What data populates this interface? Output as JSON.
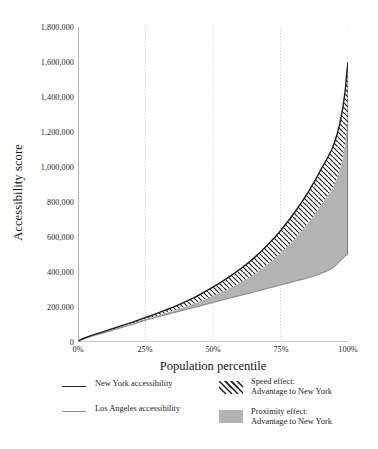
{
  "chart_data": {
    "type": "area",
    "title": "",
    "xlabel": "Population percentile",
    "ylabel": "Accessibility score",
    "xlim": [
      0,
      100
    ],
    "ylim": [
      0,
      1800000
    ],
    "grid": "vertical-dotted",
    "x_ticks": [
      "0%",
      "25%",
      "50%",
      "75%",
      "100%"
    ],
    "x_tick_values": [
      0,
      25,
      50,
      75,
      100
    ],
    "y_ticks": [
      "0",
      "200,000",
      "400,000",
      "600,000",
      "800,000",
      "1,000,000",
      "1,200,000",
      "1,400,000",
      "1,600,000",
      "1,800,000"
    ],
    "y_tick_values": [
      0,
      200000,
      400000,
      600000,
      800000,
      1000000,
      1200000,
      1400000,
      1600000,
      1800000
    ],
    "x": [
      0,
      2,
      5,
      8,
      10,
      15,
      20,
      25,
      28,
      30,
      33,
      35,
      38,
      40,
      43,
      45,
      48,
      50,
      53,
      55,
      58,
      60,
      63,
      65,
      68,
      70,
      73,
      75,
      78,
      80,
      83,
      85,
      88,
      90,
      92,
      94,
      95,
      96,
      97,
      98,
      99,
      99.5,
      100
    ],
    "series": [
      {
        "name": "New York accessibility",
        "color": "#222222",
        "values": [
          6000,
          20000,
          38000,
          52000,
          62000,
          88000,
          112000,
          140000,
          156000,
          168000,
          186000,
          198000,
          218000,
          232000,
          254000,
          270000,
          296000,
          314000,
          342000,
          362000,
          394000,
          416000,
          452000,
          478000,
          520000,
          552000,
          600000,
          636000,
          694000,
          736000,
          802000,
          850000,
          928000,
          986000,
          1040000,
          1100000,
          1140000,
          1190000,
          1250000,
          1330000,
          1440000,
          1530000,
          1600000
        ]
      },
      {
        "name": "Los Angeles accessibility",
        "color": "#8e8e8e",
        "values": [
          4000,
          17000,
          33000,
          46000,
          55000,
          78000,
          100000,
          125000,
          138000,
          146000,
          158000,
          166000,
          178000,
          186000,
          198000,
          206000,
          218000,
          226000,
          238000,
          246000,
          258000,
          266000,
          278000,
          286000,
          298000,
          306000,
          318000,
          326000,
          338000,
          346000,
          358000,
          366000,
          380000,
          392000,
          404000,
          420000,
          432000,
          446000,
          462000,
          478000,
          492000,
          498000,
          500000
        ]
      },
      {
        "name": "speed-effect-band-lower",
        "color": "#ffffff",
        "values": [
          5000,
          18500,
          35000,
          48500,
          58000,
          82000,
          105000,
          131000,
          145000,
          154000,
          169000,
          178000,
          193000,
          203000,
          220000,
          231000,
          250000,
          263000,
          284000,
          299000,
          322000,
          339000,
          366000,
          386000,
          418000,
          443000,
          480000,
          508000,
          553000,
          586000,
          638000,
          676000,
          738000,
          784000,
          826000,
          873000,
          904000,
          942000,
          988000,
          1050000,
          1140000,
          1210000,
          1265000
        ]
      }
    ],
    "annotations": [
      "Speed effect: hatched band between New York curve and intermediate curve",
      "Proximity effect: solid gray fill between intermediate curve and Los Angeles curve"
    ],
    "legend": {
      "position": "below-axes",
      "entries": [
        {
          "label": "New York accessibility",
          "marker": "line",
          "color": "#222222"
        },
        {
          "label": "Los Angeles accessibility",
          "marker": "line",
          "color": "#8e8e8e"
        },
        {
          "label_line1": "Speed effect:",
          "label_line2": "Advantage to New York",
          "marker": "hatch"
        },
        {
          "label_line1": "Proximity effect:",
          "label_line2": "Advantage to New York",
          "marker": "solid",
          "color": "#b3b3b3"
        }
      ]
    }
  },
  "axes": {
    "y_title": "Accessibility score",
    "x_title": "Population percentile",
    "y_tick_labels": [
      "1,800,000",
      "1,600,000",
      "1,400,000",
      "1,200,000",
      "1,000,000",
      "800,000",
      "600,000",
      "400,000",
      "200,000",
      "0"
    ],
    "x_tick_labels": [
      "0%",
      "25%",
      "50%",
      "75%",
      "100%"
    ]
  },
  "legend": {
    "new_york_label": "New York accessibility",
    "los_angeles_label": "Los Angeles accessibility",
    "speed_effect_line1": "Speed effect:",
    "speed_effect_line2": "Advantage to New York",
    "proximity_effect_line1": "Proximity effect:",
    "proximity_effect_line2": "Advantage to New York"
  },
  "colors": {
    "new_york_line": "#222222",
    "los_angeles_line": "#8e8e8e",
    "proximity_fill": "#b3b3b3",
    "gridline": "#c9c9c9",
    "axis": "#6f6f6f",
    "text": "#1a1a1a"
  }
}
